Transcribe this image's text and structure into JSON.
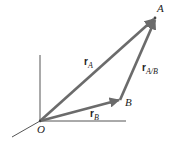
{
  "diagram": {
    "colors": {
      "vector": "#6b6b6b",
      "axis": "#555555",
      "text": "#222222"
    },
    "points": {
      "O": {
        "label": "O",
        "x": 40,
        "y": 121
      },
      "A": {
        "label": "A",
        "x": 155,
        "y": 18
      },
      "B": {
        "label": "B",
        "x": 120,
        "y": 100
      }
    },
    "vectors": [
      {
        "id": "rA",
        "base": "r",
        "sub": "A",
        "from": "O",
        "to": "A"
      },
      {
        "id": "rB",
        "base": "r",
        "sub": "B",
        "from": "O",
        "to": "B"
      },
      {
        "id": "rAB",
        "base": "r",
        "sub": "A/B",
        "from": "B",
        "to": "A"
      }
    ],
    "axes": [
      "vertical",
      "horizontal",
      "diagonal"
    ]
  }
}
